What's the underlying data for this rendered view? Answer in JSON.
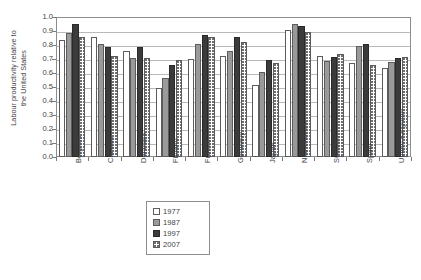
{
  "chart_data": {
    "type": "bar",
    "title": "",
    "xlabel": "",
    "ylabel": "Labour productivity relative to the United States",
    "ylabel_line1": "Labour productivity relative to",
    "ylabel_line2": "the United States",
    "ylim": [
      0.0,
      1.0
    ],
    "ytick_labels": [
      "1.0",
      "0.9",
      "0.8",
      "0.7",
      "0.6",
      "0.5",
      "0.4",
      "0.3",
      "0.2",
      "0.1",
      "0.0"
    ],
    "ytick_values": [
      1.0,
      0.9,
      0.8,
      0.7,
      0.6,
      0.5,
      0.4,
      0.3,
      0.2,
      0.1,
      0.0
    ],
    "grid": true,
    "grid_axis": "y",
    "legend_position": "bottom-center",
    "categories": [
      "Belgium",
      "Canada",
      "Denmark",
      "Finland",
      "France",
      "Germany",
      "Japan",
      "Netherlands",
      "Sweden",
      "Spain",
      "United Kingdom"
    ],
    "series": [
      {
        "name": "1977",
        "color": "#ffffff",
        "values": [
          0.835,
          0.86,
          0.755,
          0.49,
          0.7,
          0.72,
          0.515,
          0.905,
          0.725,
          0.67,
          0.635
        ]
      },
      {
        "name": "1987",
        "color": "#9a9a9a",
        "values": [
          0.885,
          0.81,
          0.71,
          0.565,
          0.81,
          0.755,
          0.605,
          0.95,
          0.685,
          0.795,
          0.68
        ]
      },
      {
        "name": "1997",
        "color": "#3b3b3b",
        "values": [
          0.95,
          0.785,
          0.785,
          0.655,
          0.87,
          0.855,
          0.695,
          0.935,
          0.715,
          0.81,
          0.705
        ]
      },
      {
        "name": "2007",
        "color": "#ffffff",
        "pattern": "dotted",
        "values": [
          0.855,
          0.725,
          0.71,
          0.69,
          0.855,
          0.825,
          0.675,
          0.89,
          0.735,
          0.66,
          0.715
        ]
      }
    ]
  },
  "legend": {
    "items": [
      {
        "label": "1977",
        "swatch": "swatch-1977"
      },
      {
        "label": "1987",
        "swatch": "swatch-1987"
      },
      {
        "label": "1997",
        "swatch": "swatch-1997"
      },
      {
        "label": "2007",
        "swatch": "swatch-2007"
      }
    ]
  }
}
